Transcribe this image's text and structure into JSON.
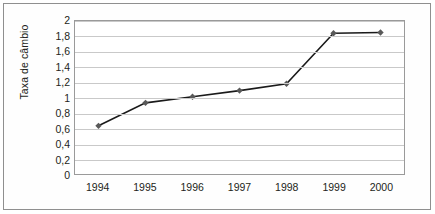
{
  "chart_data": {
    "type": "line",
    "title": "",
    "subtitle": "",
    "xlabel": "",
    "ylabel": "Taxa de câmbio",
    "categories": [
      "1994",
      "1995",
      "1996",
      "1997",
      "1998",
      "1999",
      "2000"
    ],
    "x": [
      1994,
      1995,
      1996,
      1997,
      1998,
      1999,
      2000
    ],
    "values": [
      0.63,
      0.93,
      1.01,
      1.09,
      1.18,
      1.84,
      1.85
    ],
    "series": [
      {
        "name": "Taxa de câmbio",
        "values": [
          0.63,
          0.93,
          1.01,
          1.09,
          1.18,
          1.84,
          1.85
        ]
      }
    ],
    "ylim": [
      0,
      2
    ],
    "ytick_values": [
      0,
      0.2,
      0.4,
      0.6,
      0.8,
      1,
      1.2,
      1.4,
      1.6,
      1.8,
      2
    ],
    "ytick_labels": [
      "0",
      "0,2",
      "0,4",
      "0,6",
      "0,8",
      "1",
      "1,2",
      "1,4",
      "1,6",
      "1,8",
      "2"
    ],
    "grid": "horizontal",
    "legend": "none",
    "marker": "diamond",
    "line_color": "#1a1a1a",
    "marker_color": "#595959",
    "grid_color": "#c9c9c9",
    "plot_border_color": "#9a9a9a",
    "frame_color": "#8f8f8f",
    "background_color": "#ffffff",
    "text_color": "#231f20"
  }
}
